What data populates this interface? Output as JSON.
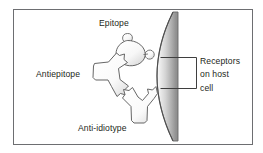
{
  "figure": {
    "frame": {
      "border_color": "#6d6e71",
      "background": "#ffffff"
    },
    "labels": {
      "epitope": "Epitope",
      "antiepitope": "Antiepitope",
      "antiidiotype": "Anti-idiotype",
      "receptors_line1": "Receptors",
      "receptors_line2": "on host",
      "receptors_line3": "cell"
    },
    "elements": {
      "epitope_shape": "rounded-blob-with-three-lobes",
      "antiepitope_shape": "y-shaped-antibody-pointing-right",
      "antiidiotype_shape": "y-shaped-antibody-pointing-up",
      "host_cell_shape": "vertical-curved-membrane-gradient",
      "bracket_shape": "right-facing-bracket-with-two-leader-lines"
    },
    "colors": {
      "outline": "#58595b",
      "shape_fill": "#fdfdfd",
      "shape_shadow": "#d9d9d9",
      "cell_gradient_light": "#f2f2f2",
      "cell_gradient_mid": "#c9c9c9",
      "cell_gradient_dark": "#8a8a8a",
      "text": "#231f20",
      "leader_line": "#3f3f3f"
    }
  }
}
